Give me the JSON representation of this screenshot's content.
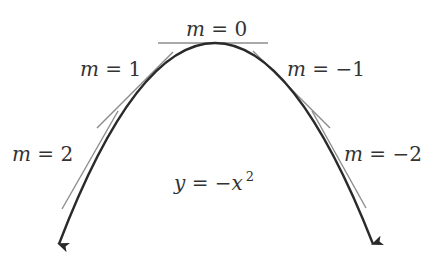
{
  "diagram": {
    "curve": {
      "equation_label": "y = −x²",
      "label_parts": {
        "lhs": "y",
        "eq": " = −",
        "var": "x",
        "exp": "2"
      },
      "color": "#2a2a2a"
    },
    "tangent_color": "#8c8c8c",
    "tangents": [
      {
        "slope": 0,
        "label": "m = 0",
        "parts": {
          "m": "m",
          "rest": " = 0"
        }
      },
      {
        "slope": 1,
        "label": "m = 1",
        "parts": {
          "m": "m",
          "rest": " = 1"
        }
      },
      {
        "slope": -1,
        "label": "m = −1",
        "parts": {
          "m": "m",
          "rest": " = −1"
        }
      },
      {
        "slope": 2,
        "label": "m = 2",
        "parts": {
          "m": "m",
          "rest": " = 2"
        }
      },
      {
        "slope": -2,
        "label": "m = −2",
        "parts": {
          "m": "m",
          "rest": " = −2"
        }
      }
    ]
  }
}
